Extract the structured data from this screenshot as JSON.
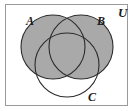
{
  "figure": {
    "type": "venn-diagram",
    "universe_label": "U",
    "sets": [
      {
        "id": "A",
        "label": "A",
        "shaded": true,
        "position": "top-left"
      },
      {
        "id": "B",
        "label": "B",
        "shaded": true,
        "position": "top-right"
      },
      {
        "id": "C",
        "label": "C",
        "shaded": false,
        "position": "bottom-center"
      }
    ],
    "shaded_region_description": "A union B",
    "colors": {
      "shade_fill": "#a9a9a9",
      "circle_stroke": "#2b2b2b",
      "frame_stroke": "#9a9a9a",
      "background": "#ffffff",
      "label_color": "#1a1a1a"
    },
    "geometry": {
      "frame": {
        "x": 5,
        "y": 4,
        "width": 123,
        "height": 102
      },
      "circle_a": {
        "cx": 53,
        "cy": 47,
        "r": 32
      },
      "circle_b": {
        "cx": 81,
        "cy": 47,
        "r": 32
      },
      "circle_c": {
        "cx": 67,
        "cy": 65,
        "r": 32
      }
    }
  }
}
